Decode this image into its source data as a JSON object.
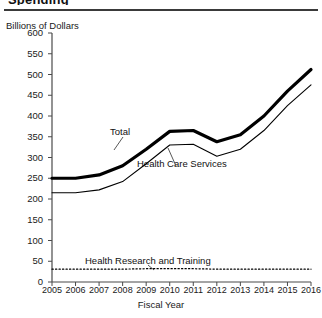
{
  "figure": {
    "title_partial": "Spending",
    "has_top_rule": true
  },
  "axes": {
    "y_axis_title": "Billions of Dollars",
    "x_axis_title": "Fiscal Year",
    "y_ticks": [
      600,
      550,
      500,
      450,
      400,
      350,
      300,
      250,
      200,
      150,
      100,
      50,
      0
    ],
    "x_ticks": [
      "2005",
      "2006",
      "2007",
      "2008",
      "2009",
      "2010",
      "2011",
      "2012",
      "2013",
      "2014",
      "2015",
      "2016"
    ]
  },
  "series_labels": {
    "total": "Total",
    "health_care_services": "Health Care Services",
    "health_research_and_training": "Health Research and Training"
  },
  "chart_data": {
    "type": "line",
    "title": "Billions of Dollars",
    "xlabel": "Fiscal Year",
    "ylabel": "Billions of Dollars",
    "xlim": [
      2005,
      2016
    ],
    "ylim": [
      0,
      600
    ],
    "ytick_interval": 50,
    "grid": false,
    "legend": "inline-annotations",
    "x": [
      2005,
      2006,
      2007,
      2008,
      2009,
      2010,
      2011,
      2012,
      2013,
      2014,
      2015,
      2016
    ],
    "series": [
      {
        "name": "Total",
        "style": "thick-solid",
        "color": "#000000",
        "values": [
          250,
          250,
          258,
          280,
          320,
          363,
          365,
          338,
          355,
          400,
          460,
          512
        ]
      },
      {
        "name": "Health Care Services",
        "style": "thin-solid",
        "color": "#000000",
        "values": [
          215,
          215,
          222,
          242,
          285,
          330,
          332,
          303,
          320,
          365,
          425,
          475
        ]
      },
      {
        "name": "Health Research and Training",
        "style": "dotted",
        "color": "#000000",
        "values": [
          31,
          31,
          31,
          31,
          32,
          32,
          32,
          31,
          31,
          31,
          31,
          31
        ]
      }
    ]
  }
}
